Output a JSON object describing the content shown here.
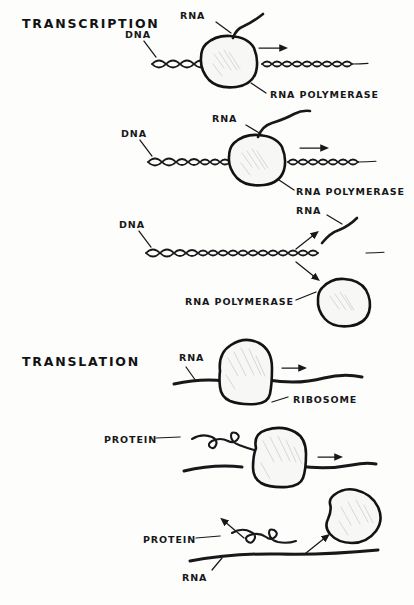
{
  "figure": {
    "medium": "hand-drawn ink sketch",
    "background_color": "#fdfdfc",
    "ink_color": "#18181b",
    "blob_fill_color": "#f7f7f5"
  },
  "sections": [
    {
      "id": "transcription",
      "heading": "TRANSCRIPTION"
    },
    {
      "id": "translation",
      "heading": "TRANSLATION"
    }
  ],
  "panels": [
    {
      "id": "panel-1",
      "section": "transcription",
      "caption": "RNA polymerase bound to DNA, short RNA transcript emerging",
      "labels": [
        {
          "name": "dna-label",
          "text": "DNA"
        },
        {
          "name": "rna-label",
          "text": "RNA"
        },
        {
          "name": "rna-polymerase-label",
          "text": "RNA POLYMERASE"
        }
      ],
      "arrows": [
        {
          "name": "direction-arrow",
          "direction": "right"
        }
      ]
    },
    {
      "id": "panel-2",
      "section": "transcription",
      "caption": "Polymerase has advanced along DNA, RNA transcript is longer",
      "labels": [
        {
          "name": "dna-label",
          "text": "DNA"
        },
        {
          "name": "rna-label",
          "text": "RNA"
        },
        {
          "name": "rna-polymerase-label",
          "text": "RNA POLYMERASE"
        }
      ],
      "arrows": [
        {
          "name": "direction-arrow",
          "direction": "right"
        }
      ]
    },
    {
      "id": "panel-3",
      "section": "transcription",
      "caption": "Transcription complete: RNA and polymerase released from DNA",
      "labels": [
        {
          "name": "dna-label",
          "text": "DNA"
        },
        {
          "name": "rna-label",
          "text": "RNA"
        },
        {
          "name": "rna-polymerase-label",
          "text": "RNA POLYMERASE"
        }
      ],
      "arrows": [
        {
          "name": "rna-release-arrow",
          "direction": "up-right"
        },
        {
          "name": "polymerase-release-arrow",
          "direction": "down-right"
        }
      ]
    },
    {
      "id": "panel-4",
      "section": "translation",
      "caption": "Ribosome bound to RNA strand beginning translation",
      "labels": [
        {
          "name": "rna-label",
          "text": "RNA"
        },
        {
          "name": "ribosome-label",
          "text": "RIBOSOME"
        }
      ],
      "arrows": [
        {
          "name": "direction-arrow",
          "direction": "right"
        }
      ]
    },
    {
      "id": "panel-5",
      "section": "translation",
      "caption": "Ribosome advancing along RNA, protein chain emerging",
      "labels": [
        {
          "name": "protein-label",
          "text": "PROTEIN"
        }
      ],
      "arrows": [
        {
          "name": "direction-arrow",
          "direction": "right"
        }
      ]
    },
    {
      "id": "panel-6",
      "section": "translation",
      "caption": "Translation complete: protein and ribosome released from RNA",
      "labels": [
        {
          "name": "protein-label",
          "text": "PROTEIN"
        },
        {
          "name": "rna-label",
          "text": "RNA"
        }
      ],
      "arrows": [
        {
          "name": "protein-release-arrow",
          "direction": "up-left"
        },
        {
          "name": "ribosome-release-arrow",
          "direction": "up-right"
        }
      ]
    }
  ]
}
